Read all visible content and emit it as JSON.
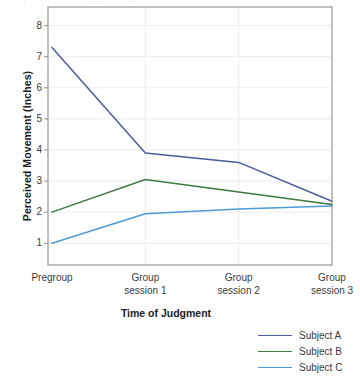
{
  "chart_data": {
    "type": "line",
    "title": "",
    "xlabel": "Time of Judgment",
    "ylabel": "Perceived Movement (Inches)",
    "categories": [
      "Pregroup",
      "Group session 1",
      "Group session 2",
      "Group session 3"
    ],
    "category_lines": [
      [
        "Pregroup",
        ""
      ],
      [
        "Group",
        "session 1"
      ],
      [
        "Group",
        "session 2"
      ],
      [
        "Group",
        "session 3"
      ]
    ],
    "yticks": [
      1,
      2,
      3,
      4,
      5,
      6,
      7,
      8
    ],
    "ylim": [
      0.3,
      8.6
    ],
    "grid": "horizontal-faint",
    "legend_position": "below-right",
    "series": [
      {
        "name": "Subject A",
        "color": "#4c5b9c",
        "values": [
          7.3,
          3.9,
          3.6,
          2.35
        ]
      },
      {
        "name": "Subject B",
        "color": "#3f7a40",
        "values": [
          2.0,
          3.05,
          2.65,
          2.25
        ]
      },
      {
        "name": "Subject C",
        "color": "#4c9bd4",
        "values": [
          1.0,
          1.95,
          2.1,
          2.2
        ]
      }
    ]
  },
  "axis": {
    "ytick_labels": [
      "8",
      "7",
      "6",
      "5",
      "4",
      "3",
      "2",
      "1"
    ],
    "xlabel_text": "Time of Judgment",
    "ylabel_text": "Perceived Movement (Inches)"
  },
  "legend": {
    "items": [
      {
        "label": "Subject A",
        "color": "#4c5b9c"
      },
      {
        "label": "Subject B",
        "color": "#3f7a40"
      },
      {
        "label": "Subject C",
        "color": "#4c9bd4"
      }
    ]
  },
  "colors": {
    "frame": "#8d8d8d",
    "gridline": "#e9e9ee",
    "tick_text": "#3a3a3a",
    "axis_title": "#1c1c1c",
    "background": "#ffffff"
  }
}
